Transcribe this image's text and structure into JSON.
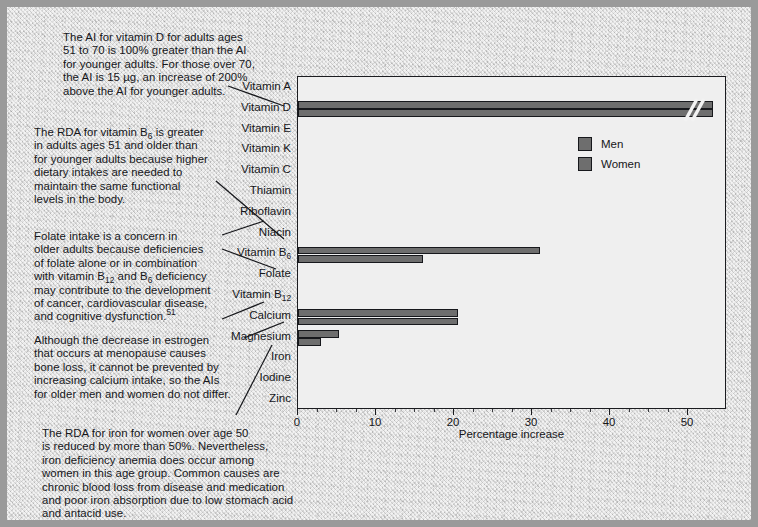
{
  "figure": {
    "xtitle": "Percentage increase"
  },
  "legend": {
    "items": [
      {
        "label": "Men",
        "color": "#6e6e6e"
      },
      {
        "label": "Women",
        "color": "#6e6e6e"
      }
    ]
  },
  "notes": [
    {
      "id": "vitamin-d-note",
      "text": "The AI for vitamin D for adults ages\n51 to 70 is 100% greater than the AI\nfor younger adults. For those over 70,\nthe AI is 15 µg, an increase of 200%\nabove the AI for younger adults."
    },
    {
      "id": "vitamin-b6-note",
      "text_pre": "The RDA for vitamin B",
      "sub": "6",
      "text_post": " is greater\nin adults ages 51 and older than\nfor younger adults because higher\ndietary intakes are needed to\nmaintain the same functional\nlevels in the body."
    },
    {
      "id": "folate-note",
      "line1": "Folate intake is a concern in",
      "line2": "older adults because deficiencies",
      "line3": "of folate alone or in combination",
      "line4_a": "with vitamin B",
      "line4_sub1": "12",
      "line4_b": " and B",
      "line4_sub2": "6",
      "line4_c": " deficiency",
      "line5": "may contribute to the development",
      "line6": "of cancer, cardiovascular disease,",
      "line7_a": "and cognitive dysfunction.",
      "line7_sup": "51"
    },
    {
      "id": "calcium-note",
      "text": "Although the decrease in estrogen\nthat occurs at menopause causes\nbone loss, it cannot be prevented by\nincreasing calcium intake, so the AIs\nfor older men and women do not differ."
    },
    {
      "id": "iron-note",
      "text": "The RDA for iron for women over age 50\nis reduced by more than 50%. Nevertheless,\niron deficiency anemia does occur among\nwomen in this age group. Common causes are\nchronic blood loss from disease and medication\nand poor iron absorption due to low stomach acid\nand antacid use."
    }
  ],
  "chart_data": {
    "type": "bar",
    "orientation": "horizontal",
    "title": "",
    "xlabel": "Percentage increase",
    "ylabel": "",
    "xlim": [
      0,
      55
    ],
    "xticks": [
      0,
      10,
      20,
      30,
      40,
      50
    ],
    "minor_tick_step": 2.5,
    "axis_break": {
      "present": true,
      "after_value": 52,
      "style": "double-slash"
    },
    "grid": false,
    "legend_position": "upper-right-inside",
    "categories": [
      "Vitamin A",
      "Vitamin D",
      "Vitamin E",
      "Vitamin K",
      "Vitamin C",
      "Thiamin",
      "Riboflavin",
      "Niacin",
      "Vitamin B6",
      "Folate",
      "Vitamin B12",
      "Calcium",
      "Magnesium",
      "Iron",
      "Iodine",
      "Zinc"
    ],
    "category_labels_display": [
      "Vitamin A",
      "Vitamin D",
      "Vitamin E",
      "Vitamin K",
      "Vitamin C",
      "Thiamin",
      "Riboflavin",
      "Niacin",
      "Vitamin B₆",
      "Folate",
      "Vitamin B₁₂",
      "Calcium",
      "Magnesium",
      "Iron",
      "Iodine",
      "Zinc"
    ],
    "series": [
      {
        "name": "Men",
        "values": [
          0,
          100,
          0,
          0,
          0,
          0,
          0,
          0,
          31.0,
          0,
          0,
          20.5,
          5.3,
          0,
          0,
          0
        ]
      },
      {
        "name": "Women",
        "values": [
          0,
          200,
          0,
          0,
          0,
          0,
          0,
          0,
          16.0,
          0,
          0,
          20.5,
          3.0,
          0,
          0,
          0
        ]
      }
    ],
    "notes_on_data": "Vitamin D bars are drawn past the axis break; their true values are 100% (men) and 200% (women)."
  }
}
